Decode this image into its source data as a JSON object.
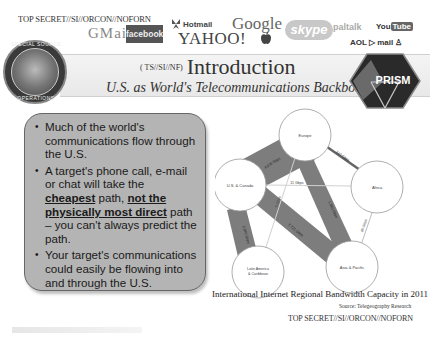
{
  "classification": {
    "top": "TOP SECRET//SI//ORCON//NOFORN",
    "bottom": "TOP SECRET//SI//ORCON//NOFORN"
  },
  "provider_logos": {
    "gmail": "GMail",
    "facebook": "facebook",
    "hotmail": "Hotmail",
    "yahoo": "YAHOO!",
    "google": "Google",
    "apple": "apple-icon",
    "skype": "skype",
    "paltalk": "paltalk",
    "youtube_you": "You",
    "youtube_tube": "Tube",
    "aol": "AOL ▷ mail ♙"
  },
  "header": {
    "seal_top_text": "SPECIAL SOURCE",
    "seal_bottom_text": "OPERATIONS",
    "title_prefix": "( TS//SI//NF)",
    "title": "Introduction",
    "subtitle": "U.S. as World's Telecommunications Backbone",
    "prism_label": "PRISM"
  },
  "bullets": {
    "b1": "Much of the world's communications flow through the U.S.",
    "b2_part1": "A target's phone call, e-mail or chat will take the ",
    "b2_bold1": "cheapest",
    "b2_part2": " path, ",
    "b2_bold2": "not the physically most direct",
    "b2_part3": " path – you can't always predict the path.",
    "b3": "Your target's communications could easily be flowing into and through the U.S."
  },
  "diagram": {
    "nodes": [
      {
        "id": "europe",
        "label": "Europe"
      },
      {
        "id": "us",
        "label": "U.S. & Canada"
      },
      {
        "id": "africa",
        "label": "Africa"
      },
      {
        "id": "latam",
        "label_line1": "Latin America",
        "label_line2": "& Caribbean"
      },
      {
        "id": "asia",
        "label": "Asia & Pacific"
      }
    ],
    "links": [
      {
        "from": "us",
        "to": "europe",
        "label": "4,970 Gbps"
      },
      {
        "from": "europe",
        "to": "africa",
        "label": "343 Gbps"
      },
      {
        "from": "us",
        "to": "africa",
        "label": "11 Gbps"
      },
      {
        "from": "europe",
        "to": "asia",
        "label": "1,360 Gbps"
      },
      {
        "from": "us",
        "to": "latam",
        "label": "2,946 Gbps"
      },
      {
        "from": "us",
        "to": "asia",
        "label": "2,721 Gbps"
      },
      {
        "from": "africa",
        "to": "asia",
        "label": "45 Gbps"
      },
      {
        "from": "europe",
        "to": "latam",
        "label": "5 Gbps"
      }
    ],
    "caption": "International Internet Regional Bandwidth Capacity in 2011",
    "source": "Source: Telegeography Research"
  }
}
